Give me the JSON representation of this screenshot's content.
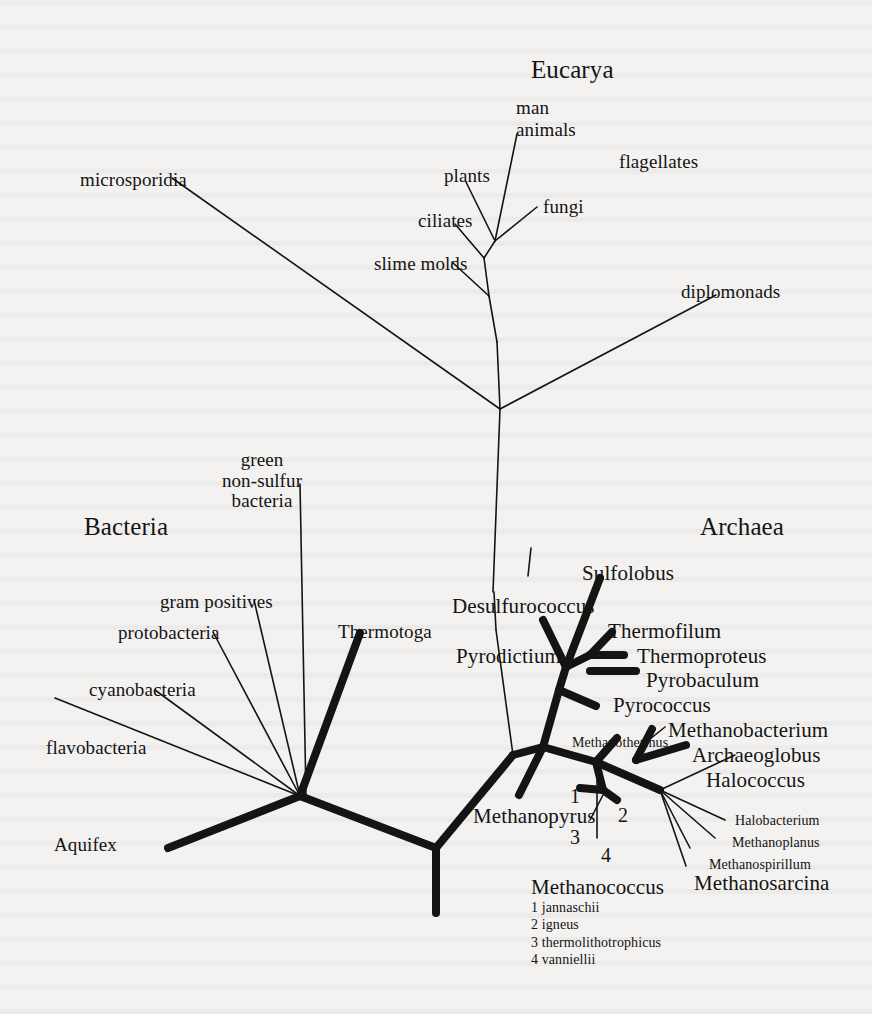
{
  "figure": {
    "type": "phylogenetic-tree",
    "style": "unrooted universal tree of life",
    "background_color": "#f3f2f0",
    "line_color": "#141414"
  },
  "domains": [
    {
      "name": "eucarya",
      "label": "Eucarya",
      "x": 531,
      "y": 56
    },
    {
      "name": "bacteria",
      "label": "Bacteria",
      "x": 84,
      "y": 513
    },
    {
      "name": "archaea",
      "label": "Archaea",
      "x": 700,
      "y": 513
    }
  ],
  "eucarya_taxa": [
    {
      "name": "man",
      "label": "man",
      "x": 516,
      "y": 98
    },
    {
      "name": "animals",
      "label": "animals",
      "x": 516,
      "y": 120
    },
    {
      "name": "plants",
      "label": "plants",
      "x": 444,
      "y": 166
    },
    {
      "name": "fungi",
      "label": "fungi",
      "x": 543,
      "y": 197
    },
    {
      "name": "flagellates",
      "label": "flagellates",
      "x": 619,
      "y": 152
    },
    {
      "name": "ciliates",
      "label": "ciliates",
      "x": 418,
      "y": 211
    },
    {
      "name": "slime-molds",
      "label": "slime molds",
      "x": 374,
      "y": 254
    },
    {
      "name": "microsporidia",
      "label": "microsporidia",
      "x": 80,
      "y": 170
    },
    {
      "name": "diplomonads",
      "label": "diplomonads",
      "x": 681,
      "y": 282
    }
  ],
  "bacteria_taxa": [
    {
      "name": "green-non-sulfur-bacteria",
      "label_lines": [
        "green",
        "non-sulfur",
        "bacteria"
      ],
      "x": 262,
      "y": 450
    },
    {
      "name": "gram-positives",
      "label": "gram positives",
      "x": 160,
      "y": 592
    },
    {
      "name": "protobacteria",
      "label": "protobacteria",
      "x": 118,
      "y": 623
    },
    {
      "name": "cyanobacteria",
      "label": "cyanobacteria",
      "x": 89,
      "y": 680
    },
    {
      "name": "flavobacteria",
      "label": "flavobacteria",
      "x": 46,
      "y": 738
    },
    {
      "name": "aquifex",
      "label": "Aquifex",
      "x": 54,
      "y": 835
    },
    {
      "name": "thermotoga",
      "label": "Thermotoga",
      "x": 338,
      "y": 622
    }
  ],
  "archaea_taxa": [
    {
      "name": "sulfolobus",
      "label": "Sulfolobus",
      "x": 582,
      "y": 562
    },
    {
      "name": "desulfurococcus",
      "label": "Desulfurococcus",
      "x": 452,
      "y": 595
    },
    {
      "name": "thermofilum",
      "label": "Thermofilum",
      "x": 608,
      "y": 620
    },
    {
      "name": "thermoproteus",
      "label": "Thermoproteus",
      "x": 637,
      "y": 645
    },
    {
      "name": "pyrodictium",
      "label": "Pyrodictium",
      "x": 456,
      "y": 645
    },
    {
      "name": "pyrobaculum",
      "label": "Pyrobaculum",
      "x": 646,
      "y": 669
    },
    {
      "name": "pyrococcus",
      "label": "Pyrococcus",
      "x": 613,
      "y": 694
    },
    {
      "name": "methanobacterium",
      "label": "Methanobacterium",
      "x": 668,
      "y": 719
    },
    {
      "name": "methanothermus",
      "label": "Methanothermus",
      "x": 572,
      "y": 735,
      "size": "small"
    },
    {
      "name": "archaeoglobus",
      "label": "Archaeoglobus",
      "x": 692,
      "y": 744
    },
    {
      "name": "halococcus",
      "label": "Halococcus",
      "x": 706,
      "y": 769
    },
    {
      "name": "methanopyrus",
      "label": "Methanopyrus",
      "x": 473,
      "y": 805
    },
    {
      "name": "halobacterium",
      "label": "Halobacterium",
      "x": 735,
      "y": 813,
      "size": "small"
    },
    {
      "name": "methanoplanus",
      "label": "Methanoplanus",
      "x": 732,
      "y": 835,
      "size": "small"
    },
    {
      "name": "methanospirillum",
      "label": "Methanospirillum",
      "x": 709,
      "y": 857,
      "size": "small"
    },
    {
      "name": "methanosarcina",
      "label": "Methanosarcina",
      "x": 694,
      "y": 872
    }
  ],
  "branch_numbers": [
    {
      "name": "branch-number-1",
      "label": "1",
      "x": 570,
      "y": 786
    },
    {
      "name": "branch-number-2",
      "label": "2",
      "x": 618,
      "y": 805
    },
    {
      "name": "branch-number-3",
      "label": "3",
      "x": 570,
      "y": 827
    },
    {
      "name": "branch-number-4",
      "label": "4",
      "x": 601,
      "y": 845
    }
  ],
  "methanococcus_legend": {
    "title": "Methanococcus",
    "x": 531,
    "y": 876,
    "items": [
      "1 jannaschii",
      "2 igneus",
      "3 thermolithotrophicus",
      "4 vanniellii"
    ]
  },
  "chart_data": {
    "type": "diagram",
    "thin_branches": [
      {
        "name": "microsporidia-branch",
        "points": [
          [
            172,
            178
          ],
          [
            500,
            409
          ]
        ]
      },
      {
        "name": "eucarya-trunk",
        "points": [
          [
            500,
            409
          ],
          [
            497,
            342
          ]
        ]
      },
      {
        "name": "eucarya-node-lower",
        "points": [
          [
            497,
            342
          ],
          [
            489,
            296
          ]
        ]
      },
      {
        "name": "slime-molds-branch",
        "points": [
          [
            489,
            296
          ],
          [
            452,
            262
          ]
        ]
      },
      {
        "name": "eucarya-node-mid",
        "points": [
          [
            489,
            296
          ],
          [
            484,
            258
          ]
        ]
      },
      {
        "name": "ciliates-branch",
        "points": [
          [
            484,
            258
          ],
          [
            455,
            224
          ]
        ]
      },
      {
        "name": "eucarya-node-upper",
        "points": [
          [
            484,
            258
          ],
          [
            495,
            241
          ]
        ]
      },
      {
        "name": "plants-branch",
        "points": [
          [
            495,
            241
          ],
          [
            466,
            182
          ]
        ]
      },
      {
        "name": "man-animals-branch",
        "points": [
          [
            495,
            241
          ],
          [
            517,
            134
          ]
        ]
      },
      {
        "name": "fungi-branch",
        "points": [
          [
            495,
            241
          ],
          [
            537,
            207
          ]
        ]
      },
      {
        "name": "diplomonads-branch",
        "points": [
          [
            500,
            409
          ],
          [
            716,
            295
          ]
        ]
      },
      {
        "name": "archaea-trunk-thin",
        "points": [
          [
            500,
            409
          ],
          [
            493,
            592
          ]
        ]
      },
      {
        "name": "desulfurococcus-pointer",
        "points": [
          [
            528,
            576
          ],
          [
            531,
            548
          ]
        ]
      },
      {
        "name": "pyrodictium-stem",
        "points": [
          [
            496,
            630
          ],
          [
            494,
            592
          ]
        ]
      },
      {
        "name": "pyrodictium-descend",
        "points": [
          [
            496,
            630
          ],
          [
            513,
            755
          ]
        ]
      },
      {
        "name": "green-nonsulfur-branch",
        "points": [
          [
            300,
            484
          ],
          [
            306,
            796
          ]
        ]
      },
      {
        "name": "gram-positives-branch",
        "points": [
          [
            254,
            600
          ],
          [
            300,
            796
          ]
        ]
      },
      {
        "name": "protobacteria-branch",
        "points": [
          [
            213,
            632
          ],
          [
            300,
            796
          ]
        ]
      },
      {
        "name": "cyanobacteria-branch",
        "points": [
          [
            155,
            690
          ],
          [
            300,
            796
          ]
        ]
      },
      {
        "name": "flavobacteria-branch",
        "points": [
          [
            55,
            698
          ],
          [
            300,
            796
          ]
        ]
      },
      {
        "name": "methanothermus-pointer",
        "points": [
          [
            640,
            747
          ],
          [
            665,
            727
          ]
        ]
      },
      {
        "name": "halococcus-pointer",
        "points": [
          [
            660,
            790
          ],
          [
            735,
            755
          ]
        ]
      },
      {
        "name": "halobacterium-pointer",
        "points": [
          [
            660,
            790
          ],
          [
            725,
            820
          ]
        ]
      },
      {
        "name": "methanoplanus-pointer",
        "points": [
          [
            660,
            790
          ],
          [
            715,
            838
          ]
        ]
      },
      {
        "name": "methanospirillum-pointer",
        "points": [
          [
            660,
            790
          ],
          [
            690,
            848
          ]
        ]
      },
      {
        "name": "methanosarcina-pointer",
        "points": [
          [
            660,
            790
          ],
          [
            686,
            866
          ]
        ]
      },
      {
        "name": "branch-3-pointer",
        "points": [
          [
            590,
            820
          ],
          [
            603,
            795
          ]
        ]
      },
      {
        "name": "branch-4-pointer",
        "points": [
          [
            597,
            838
          ],
          [
            597,
            780
          ]
        ]
      }
    ],
    "thick_branches": [
      {
        "name": "root-stem",
        "points": [
          [
            436,
            913
          ],
          [
            436,
            848
          ]
        ]
      },
      {
        "name": "bacteria-root-arm",
        "points": [
          [
            436,
            848
          ],
          [
            300,
            796
          ]
        ]
      },
      {
        "name": "archaea-root-arm",
        "points": [
          [
            436,
            848
          ],
          [
            513,
            755
          ]
        ]
      },
      {
        "name": "aquifex-branch",
        "points": [
          [
            300,
            796
          ],
          [
            168,
            848
          ]
        ]
      },
      {
        "name": "thermotoga-branch",
        "points": [
          [
            300,
            796
          ],
          [
            360,
            633
          ]
        ]
      },
      {
        "name": "archaea-split-up",
        "points": [
          [
            513,
            755
          ],
          [
            543,
            747
          ]
        ]
      },
      {
        "name": "crenarchaeota-stem",
        "points": [
          [
            543,
            747
          ],
          [
            559,
            690
          ]
        ]
      },
      {
        "name": "crenarchaeota-node",
        "points": [
          [
            559,
            690
          ],
          [
            566,
            667
          ]
        ]
      },
      {
        "name": "desulfurococcus-branch",
        "points": [
          [
            566,
            667
          ],
          [
            543,
            620
          ]
        ]
      },
      {
        "name": "sulfolobus-branch",
        "points": [
          [
            566,
            667
          ],
          [
            600,
            578
          ]
        ]
      },
      {
        "name": "thermofilum-node",
        "points": [
          [
            566,
            667
          ],
          [
            590,
            655
          ]
        ]
      },
      {
        "name": "thermofilum-branch",
        "points": [
          [
            590,
            655
          ],
          [
            612,
            632
          ]
        ]
      },
      {
        "name": "thermoproteus-branch",
        "points": [
          [
            590,
            655
          ],
          [
            624,
            655
          ]
        ]
      },
      {
        "name": "pyrobaculum-branch",
        "points": [
          [
            590,
            671
          ],
          [
            636,
            671
          ]
        ]
      },
      {
        "name": "pyrococcus-branch",
        "points": [
          [
            559,
            690
          ],
          [
            596,
            706
          ]
        ]
      },
      {
        "name": "euryarchaeota-stem",
        "points": [
          [
            543,
            747
          ],
          [
            596,
            762
          ]
        ]
      },
      {
        "name": "methanopyrus-branch",
        "points": [
          [
            543,
            747
          ],
          [
            519,
            795
          ]
        ]
      },
      {
        "name": "methanococcus-node",
        "points": [
          [
            596,
            762
          ],
          [
            603,
            790
          ]
        ]
      },
      {
        "name": "methanococcus-1",
        "points": [
          [
            603,
            790
          ],
          [
            580,
            788
          ]
        ]
      },
      {
        "name": "methanococcus-2",
        "points": [
          [
            603,
            790
          ],
          [
            617,
            800
          ]
        ]
      },
      {
        "name": "methanothermus-branch",
        "points": [
          [
            596,
            762
          ],
          [
            617,
            738
          ]
        ]
      },
      {
        "name": "euryarchaeota-upper",
        "points": [
          [
            596,
            762
          ],
          [
            660,
            790
          ]
        ]
      },
      {
        "name": "methanobacterium-branch",
        "points": [
          [
            636,
            760
          ],
          [
            652,
            729
          ]
        ]
      },
      {
        "name": "archaeoglobus-branch",
        "points": [
          [
            636,
            760
          ],
          [
            686,
            745
          ]
        ]
      }
    ]
  }
}
